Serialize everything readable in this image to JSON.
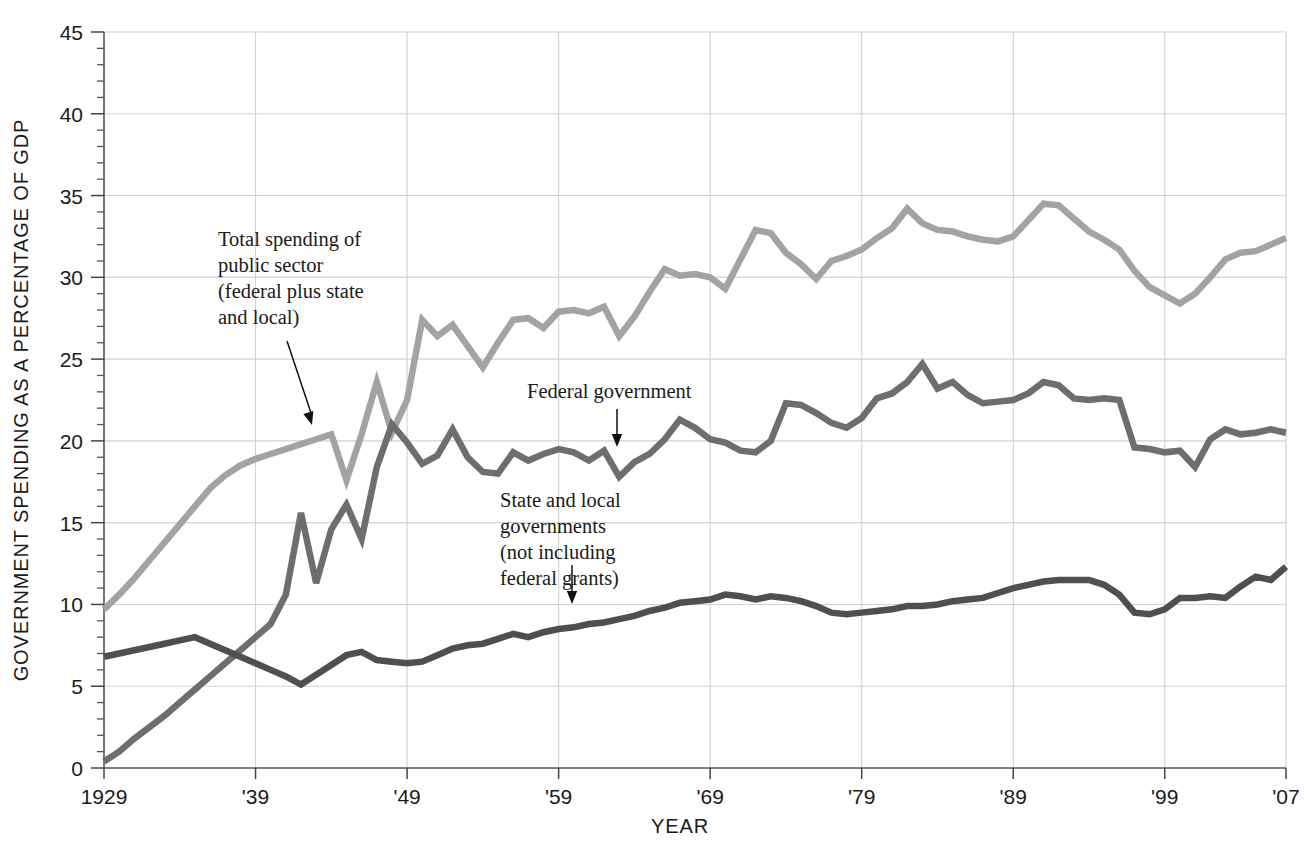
{
  "chart_data": {
    "type": "line",
    "title": "",
    "xlabel": "YEAR",
    "ylabel": "GOVERNMENT SPENDING AS A PERCENTAGE OF GDP",
    "xlim": [
      1929,
      2007
    ],
    "ylim": [
      0,
      45
    ],
    "grid": true,
    "legend_position": "inline-annotations",
    "y_ticks": [
      0,
      5,
      10,
      15,
      20,
      25,
      30,
      35,
      40,
      45
    ],
    "y_tick_labels": [
      "0",
      "5",
      "10",
      "15",
      "20",
      "25",
      "30",
      "35",
      "40",
      "45"
    ],
    "y_minor_tick_step": 1,
    "x_ticks": [
      1929,
      1939,
      1949,
      1959,
      1969,
      1979,
      1989,
      1999,
      2007
    ],
    "x_tick_labels": [
      "1929",
      "'39",
      "'49",
      "'59",
      "'69",
      "'79",
      "'89",
      "'99",
      "'07"
    ],
    "x": [
      1929,
      1930,
      1931,
      1932,
      1933,
      1934,
      1935,
      1936,
      1937,
      1938,
      1939,
      1940,
      1941,
      1942,
      1943,
      1944,
      1945,
      1946,
      1947,
      1948,
      1949,
      1950,
      1951,
      1952,
      1953,
      1954,
      1955,
      1956,
      1957,
      1958,
      1959,
      1960,
      1961,
      1962,
      1963,
      1964,
      1965,
      1966,
      1967,
      1968,
      1969,
      1970,
      1971,
      1972,
      1973,
      1974,
      1975,
      1976,
      1977,
      1978,
      1979,
      1980,
      1981,
      1982,
      1983,
      1984,
      1985,
      1986,
      1987,
      1988,
      1989,
      1990,
      1991,
      1992,
      1993,
      1994,
      1995,
      1996,
      1997,
      1998,
      1999,
      2000,
      2001,
      2002,
      2003,
      2004,
      2005,
      2006,
      2007
    ],
    "series": [
      {
        "name": "Total spending of public sector (federal plus state and local)",
        "color": "#a3a3a3",
        "values": [
          9.7,
          10.6,
          11.6,
          12.7,
          13.8,
          14.9,
          16.0,
          17.1,
          17.9,
          18.5,
          18.9,
          19.2,
          19.5,
          19.8,
          20.1,
          20.4,
          17.6,
          20.4,
          23.6,
          20.5,
          22.5,
          27.4,
          26.4,
          27.1,
          25.8,
          24.5,
          26.0,
          27.4,
          27.5,
          26.9,
          27.9,
          28.0,
          27.8,
          28.2,
          26.4,
          27.6,
          29.1,
          30.5,
          30.1,
          30.2,
          30.0,
          29.3,
          31.1,
          32.9,
          32.7,
          31.5,
          30.8,
          29.9,
          31.0,
          31.3,
          31.7,
          32.4,
          33.0,
          34.2,
          33.3,
          32.9,
          32.8,
          32.5,
          32.3,
          32.2,
          32.5,
          33.5,
          34.5,
          34.4,
          33.6,
          32.8,
          32.3,
          31.7,
          30.4,
          29.4,
          28.9,
          28.4,
          29.0,
          30.0,
          31.1,
          31.5,
          31.6,
          32.0,
          32.4
        ]
      },
      {
        "name": "Federal government",
        "color": "#6e6e6e",
        "values": [
          0.4,
          1.0,
          1.8,
          2.5,
          3.2,
          4.0,
          4.8,
          5.6,
          6.4,
          7.2,
          8.0,
          8.8,
          10.6,
          15.6,
          11.3,
          14.6,
          16.1,
          14.0,
          18.4,
          21.0,
          19.9,
          18.6,
          19.1,
          20.7,
          19.0,
          18.1,
          18.0,
          19.3,
          18.8,
          19.2,
          19.5,
          19.3,
          18.8,
          19.4,
          17.8,
          18.7,
          19.2,
          20.1,
          21.3,
          20.8,
          20.1,
          19.9,
          19.4,
          19.3,
          20.0,
          22.3,
          22.2,
          21.7,
          21.1,
          20.8,
          21.4,
          22.6,
          22.9,
          23.6,
          24.7,
          23.2,
          23.6,
          22.8,
          22.3,
          22.4,
          22.5,
          22.9,
          23.6,
          23.4,
          22.6,
          22.5,
          22.6,
          22.5,
          19.6,
          19.5,
          19.3,
          19.4,
          18.4,
          20.1,
          20.7,
          20.4,
          20.5,
          20.7,
          20.5
        ]
      },
      {
        "name": "State and local governments (not including federal grants)",
        "color": "#4f4f4f",
        "values": [
          6.8,
          7.0,
          7.2,
          7.4,
          7.6,
          7.8,
          8.0,
          7.6,
          7.2,
          6.8,
          6.4,
          6.0,
          5.6,
          5.1,
          5.7,
          6.3,
          6.9,
          7.1,
          6.6,
          6.5,
          6.4,
          6.5,
          6.9,
          7.3,
          7.5,
          7.6,
          7.9,
          8.2,
          8.0,
          8.3,
          8.5,
          8.6,
          8.8,
          8.9,
          9.1,
          9.3,
          9.6,
          9.8,
          10.1,
          10.2,
          10.3,
          10.6,
          10.5,
          10.3,
          10.5,
          10.4,
          10.2,
          9.9,
          9.5,
          9.4,
          9.5,
          9.6,
          9.7,
          9.9,
          9.9,
          10.0,
          10.2,
          10.3,
          10.4,
          10.7,
          11.0,
          11.2,
          11.4,
          11.5,
          11.5,
          11.5,
          11.2,
          10.6,
          9.5,
          9.4,
          9.7,
          10.4,
          10.4,
          10.5,
          10.4,
          11.1,
          11.7,
          11.5,
          12.3
        ]
      }
    ],
    "annotations": [
      {
        "id": "annot-total",
        "lines": [
          "Total spending of",
          "public sector",
          "(federal plus state",
          "and local)"
        ],
        "text_x": 218,
        "text_y": 246,
        "leader_from": [
          287,
          341
        ],
        "leader_to": [
          312,
          425
        ]
      },
      {
        "id": "annot-federal",
        "lines": [
          "Federal government"
        ],
        "text_x": 527,
        "text_y": 398,
        "leader_from": [
          617,
          409
        ],
        "leader_to": [
          617,
          447
        ]
      },
      {
        "id": "annot-state-local",
        "lines": [
          "State and local",
          "governments",
          "(not including",
          "federal grants)"
        ],
        "text_x": 500,
        "text_y": 507,
        "leader_from": [
          572,
          565
        ],
        "leader_to": [
          572,
          604
        ]
      }
    ]
  }
}
